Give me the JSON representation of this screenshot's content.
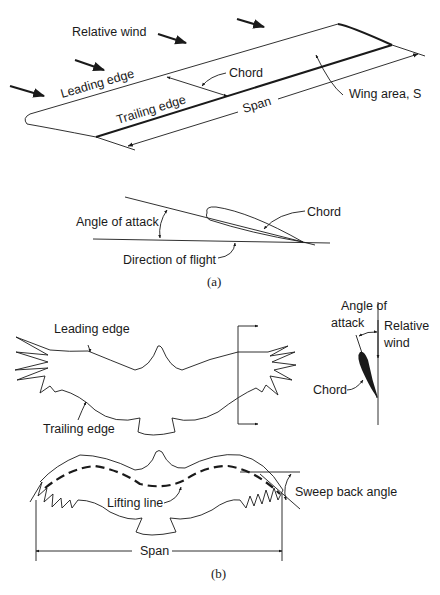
{
  "figure_a": {
    "wing": {
      "relative_wind": "Relative wind",
      "leading_edge": "Leading edge",
      "trailing_edge": "Trailing edge",
      "chord": "Chord",
      "span": "Span",
      "wing_area": "Wing area, S"
    },
    "airfoil": {
      "angle_of_attack": "Angle of attack",
      "chord": "Chord",
      "direction_of_flight": "Direction of flight"
    },
    "label": "(a)"
  },
  "figure_b": {
    "top_bird": {
      "leading_edge": "Leading edge",
      "trailing_edge": "Trailing edge"
    },
    "section": {
      "angle_of_attack_line1": "Angle of",
      "angle_of_attack_line2": "attack",
      "relative_wind_line1": "Relative",
      "relative_wind_line2": "wind",
      "chord": "Chord"
    },
    "bottom_bird": {
      "lifting_line": "Lifting line",
      "sweep_back_angle": "Sweep back angle",
      "span": "Span"
    },
    "label": "(b)"
  },
  "caption": "Figure: Definitions of wing geometry and bird-wing planform"
}
